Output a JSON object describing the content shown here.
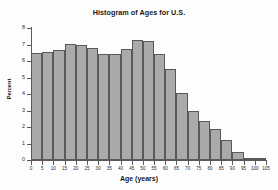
{
  "chart_data": {
    "type": "bar",
    "title": "Histogram of Ages for U.S.",
    "xlabel": "Age (years)",
    "ylabel": "Percent",
    "xlim": [
      0,
      105
    ],
    "ylim": [
      0,
      8
    ],
    "grid": false,
    "legend": null,
    "bin_width": 5,
    "bin_edges": [
      0,
      5,
      10,
      15,
      20,
      25,
      30,
      35,
      40,
      45,
      50,
      55,
      60,
      65,
      70,
      75,
      80,
      85,
      90,
      95,
      100,
      105
    ],
    "categories": [
      "0-5",
      "5-10",
      "10-15",
      "15-20",
      "20-25",
      "25-30",
      "30-35",
      "35-40",
      "40-45",
      "45-50",
      "50-55",
      "55-60",
      "60-65",
      "65-70",
      "70-75",
      "75-80",
      "80-85",
      "85-90",
      "90-95",
      "95-100",
      "100-105"
    ],
    "values": [
      6.5,
      6.55,
      6.65,
      7.05,
      6.95,
      6.8,
      6.45,
      6.45,
      6.75,
      7.3,
      7.2,
      6.4,
      5.5,
      4.05,
      3.0,
      2.35,
      1.85,
      1.2,
      0.5,
      0.1,
      0.05
    ],
    "x_tick_labels": [
      "0",
      "5",
      "10",
      "15",
      "20",
      "25",
      "30",
      "35",
      "40",
      "45",
      "50",
      "55",
      "60",
      "65",
      "70",
      "75",
      "80",
      "85",
      "90",
      "95",
      "100",
      "105"
    ],
    "y_tick_labels": [
      "0",
      "1",
      "2",
      "3",
      "4",
      "5",
      "6",
      "7",
      "8"
    ],
    "y_ticks": [
      0,
      1,
      2,
      3,
      4,
      5,
      6,
      7,
      8
    ],
    "bar_color": "#aaaaaa",
    "bar_edge_color": "#595959",
    "background_color": "#fdfdfd"
  }
}
